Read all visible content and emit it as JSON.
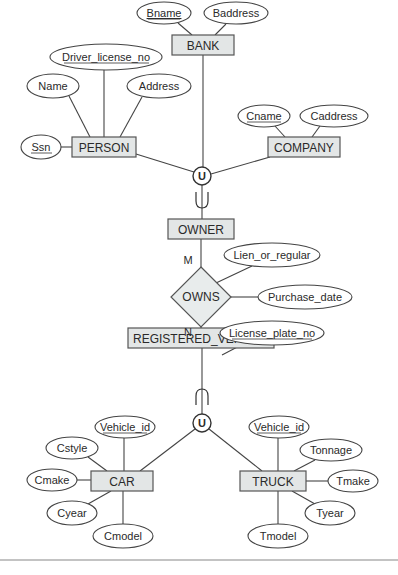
{
  "diagram": {
    "type": "EER diagram",
    "entities": [
      {
        "id": "bank",
        "label": "BANK",
        "x": 172,
        "y": 35,
        "w": 62,
        "h": 20
      },
      {
        "id": "person",
        "label": "PERSON",
        "x": 72,
        "y": 137,
        "w": 64,
        "h": 20
      },
      {
        "id": "company",
        "label": "COMPANY",
        "x": 268,
        "y": 137,
        "w": 72,
        "h": 20
      },
      {
        "id": "owner",
        "label": "OWNER",
        "x": 168,
        "y": 219,
        "w": 66,
        "h": 20
      },
      {
        "id": "registered_vehicle",
        "label": "REGISTERED_VEHICLE",
        "x": 128,
        "y": 328,
        "w": 146,
        "h": 20
      },
      {
        "id": "car",
        "label": "CAR",
        "x": 91,
        "y": 471,
        "w": 62,
        "h": 20
      },
      {
        "id": "truck",
        "label": "TRUCK",
        "x": 240,
        "y": 471,
        "w": 66,
        "h": 20
      }
    ],
    "relationships": [
      {
        "id": "owns",
        "label": "OWNS",
        "cx": 201,
        "cy": 297,
        "rx": 30,
        "ry": 30
      }
    ],
    "attributes": [
      {
        "id": "bname",
        "label": "Bname",
        "key": true,
        "cx": 164,
        "cy": 13,
        "rx": 27,
        "ry": 11,
        "of": "bank"
      },
      {
        "id": "baddress",
        "label": "Baddress",
        "cx": 236,
        "cy": 13,
        "rx": 32,
        "ry": 11,
        "of": "bank"
      },
      {
        "id": "driver_license_no",
        "label": "Driver_license_no",
        "key": true,
        "cx": 106,
        "cy": 57,
        "rx": 56,
        "ry": 13,
        "of": "person"
      },
      {
        "id": "name",
        "label": "Name",
        "cx": 53,
        "cy": 86,
        "rx": 26,
        "ry": 12,
        "of": "person"
      },
      {
        "id": "address",
        "label": "Address",
        "cx": 159,
        "cy": 86,
        "rx": 32,
        "ry": 12,
        "of": "person"
      },
      {
        "id": "ssn",
        "label": "Ssn",
        "key": true,
        "cx": 41,
        "cy": 147,
        "rx": 20,
        "ry": 12,
        "of": "person"
      },
      {
        "id": "cname",
        "label": "Cname",
        "key": true,
        "cx": 264,
        "cy": 116,
        "rx": 26,
        "ry": 11,
        "of": "company"
      },
      {
        "id": "caddress",
        "label": "Caddress",
        "cx": 334,
        "cy": 116,
        "rx": 34,
        "ry": 11,
        "of": "company"
      },
      {
        "id": "lien_or_regular",
        "label": "Lien_or_regular",
        "cx": 272,
        "cy": 255,
        "rx": 48,
        "ry": 12,
        "of": "owns"
      },
      {
        "id": "purchase_date",
        "label": "Purchase_date",
        "cx": 305,
        "cy": 297,
        "rx": 47,
        "ry": 12,
        "of": "owns"
      },
      {
        "id": "license_plate_no",
        "label": "License_plate_no",
        "key": true,
        "cx": 272,
        "cy": 333,
        "rx": 52,
        "ry": 12,
        "of": "registered_vehicle",
        "y_override": 333
      },
      {
        "id": "car_vehicle_id",
        "label": "Vehicle_id",
        "key": true,
        "cx": 125,
        "cy": 427,
        "rx": 30,
        "ry": 11,
        "of": "car"
      },
      {
        "id": "cstyle",
        "label": "Cstyle",
        "cx": 72,
        "cy": 448,
        "rx": 26,
        "ry": 11,
        "of": "car"
      },
      {
        "id": "cmake",
        "label": "Cmake",
        "cx": 52,
        "cy": 480,
        "rx": 25,
        "ry": 11,
        "of": "car"
      },
      {
        "id": "cyear",
        "label": "Cyear",
        "cx": 72,
        "cy": 513,
        "rx": 25,
        "ry": 12,
        "of": "car"
      },
      {
        "id": "cmodel",
        "label": "Cmodel",
        "cx": 123,
        "cy": 536,
        "rx": 30,
        "ry": 12,
        "of": "car"
      },
      {
        "id": "truck_vehicle_id",
        "label": "Vehicle_id",
        "key": true,
        "cx": 279,
        "cy": 427,
        "rx": 30,
        "ry": 11,
        "of": "truck"
      },
      {
        "id": "tonnage",
        "label": "Tonnage",
        "cx": 331,
        "cy": 450,
        "rx": 31,
        "ry": 11,
        "of": "truck"
      },
      {
        "id": "tmake",
        "label": "Tmake",
        "cx": 353,
        "cy": 481,
        "rx": 25,
        "ry": 11,
        "of": "truck"
      },
      {
        "id": "tyear",
        "label": "Tyear",
        "cx": 330,
        "cy": 513,
        "rx": 25,
        "ry": 12,
        "of": "truck"
      },
      {
        "id": "tmodel",
        "label": "Tmodel",
        "cx": 278,
        "cy": 536,
        "rx": 30,
        "ry": 12,
        "of": "truck"
      }
    ],
    "unions": [
      {
        "id": "union_owner",
        "label": "U",
        "cx": 202,
        "cy": 176,
        "r": 9
      },
      {
        "id": "union_vehicle",
        "label": "U",
        "cx": 202,
        "cy": 423,
        "r": 9
      }
    ],
    "cardinalities": [
      {
        "label": "M",
        "x": 188,
        "y": 262
      },
      {
        "label": "N",
        "x": 188,
        "y": 334
      }
    ]
  }
}
